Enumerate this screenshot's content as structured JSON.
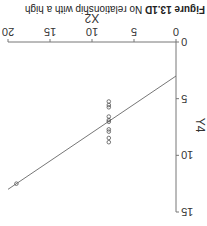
{
  "caption": {
    "label": "Figure 13.1D",
    "text": " No relationship with a high"
  },
  "chart_data": {
    "type": "scatter",
    "title": "",
    "xlabel": "X2",
    "ylabel": "Y4",
    "xlim": [
      0,
      20
    ],
    "ylim": [
      0,
      15
    ],
    "x_ticks": [
      "0",
      "5",
      "10",
      "15",
      "20"
    ],
    "y_ticks": [
      "0",
      "5",
      "10",
      "15"
    ],
    "grid": false,
    "legend": null,
    "rotation_deg": 180,
    "points": [
      {
        "x": 8,
        "y": 5.25
      },
      {
        "x": 8,
        "y": 5.56
      },
      {
        "x": 8,
        "y": 5.76
      },
      {
        "x": 8,
        "y": 6.58
      },
      {
        "x": 8,
        "y": 6.89
      },
      {
        "x": 8,
        "y": 7.04
      },
      {
        "x": 8,
        "y": 7.71
      },
      {
        "x": 8,
        "y": 7.91
      },
      {
        "x": 8,
        "y": 8.47
      },
      {
        "x": 8,
        "y": 8.84
      },
      {
        "x": 19,
        "y": 12.5
      }
    ],
    "regression_line": {
      "intercept": 3.0,
      "slope": 0.5,
      "x_range": [
        0,
        20
      ]
    }
  }
}
